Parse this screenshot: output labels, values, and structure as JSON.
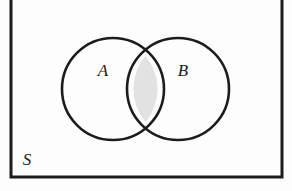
{
  "figure": {
    "kind": "venn-diagram",
    "caption_text": "",
    "background_color": "#fdfdfd",
    "stroke_color": "#1c1c1c"
  },
  "universe": {
    "label": "S",
    "label_x": 27,
    "label_y": 161,
    "rect": {
      "x": 11,
      "y": -6,
      "width": 271,
      "height": 183,
      "stroke_width": 3,
      "fill": "#fdfdfd"
    }
  },
  "sets": [
    {
      "id": "A",
      "label": "A",
      "label_x": 103,
      "label_y": 72,
      "cx": 113,
      "cy": 89,
      "r": 51,
      "stroke_width": 2.6,
      "fill": "none"
    },
    {
      "id": "B",
      "label": "B",
      "label_x": 183,
      "label_y": 72,
      "cx": 178,
      "cy": 89,
      "r": 51,
      "stroke_width": 2.6,
      "fill": "none"
    }
  ],
  "intersection": {
    "id": "A-and-B",
    "label": "",
    "fill_color": "#e2e2e2",
    "shaded": true,
    "upper_crossing_x": 145.5,
    "upper_crossing_y": 56,
    "lower_crossing_x": 145.5,
    "lower_crossing_y": 122
  },
  "geometry": {
    "lens_path": "M 145.5 56 A 51 51 0 0 0 145.5 122 A 51 51 0 0 0 145.5 56 Z"
  }
}
